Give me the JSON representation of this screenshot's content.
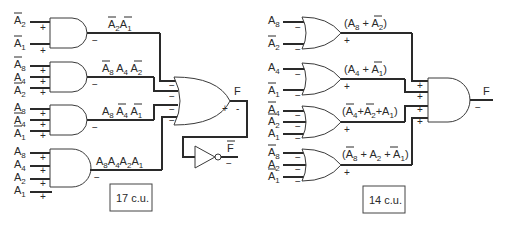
{
  "left_circuit": {
    "cost_label": "17 c.u.",
    "output_label": "F",
    "output_complement_label": "F",
    "and_gates": [
      {
        "inputs": [
          {
            "name": "A",
            "sub": "2",
            "bar": true
          },
          {
            "name": "A",
            "sub": "1",
            "bar": true
          }
        ],
        "input_polarity": "+",
        "output_polarity": "−",
        "term": "Ā2Ā1"
      },
      {
        "inputs": [
          {
            "name": "A",
            "sub": "8",
            "bar": true
          },
          {
            "name": "A",
            "sub": "4",
            "bar": false
          },
          {
            "name": "A",
            "sub": "2",
            "bar": true
          }
        ],
        "input_polarity": "+",
        "output_polarity": "−",
        "term": "Ā8A4Ā2"
      },
      {
        "inputs": [
          {
            "name": "A",
            "sub": "8",
            "bar": false
          },
          {
            "name": "A",
            "sub": "4",
            "bar": true
          },
          {
            "name": "A",
            "sub": "1",
            "bar": true
          }
        ],
        "input_polarity": "+",
        "output_polarity": "−",
        "term": "A8Ā4Ā1"
      },
      {
        "inputs": [
          {
            "name": "A",
            "sub": "8",
            "bar": false
          },
          {
            "name": "A",
            "sub": "4",
            "bar": false
          },
          {
            "name": "A",
            "sub": "2",
            "bar": false
          },
          {
            "name": "A",
            "sub": "1",
            "bar": false
          }
        ],
        "input_polarity": "+",
        "output_polarity": "−",
        "term": "A8A4A2A1"
      }
    ],
    "or_gate": {
      "input_polarity": "−",
      "output_polarity_plus": "+",
      "output_polarity_minus": "-"
    },
    "inverter": {
      "output_polarity": "−"
    }
  },
  "right_circuit": {
    "cost_label": "14 c.u.",
    "output_label": "F",
    "or_gates": [
      {
        "inputs": [
          {
            "name": "A",
            "sub": "8",
            "bar": false
          },
          {
            "name": "A",
            "sub": "2",
            "bar": true
          }
        ],
        "input_polarity": "−",
        "output_polarity": "+",
        "term": "(A8+Ā2)"
      },
      {
        "inputs": [
          {
            "name": "A",
            "sub": "4",
            "bar": false
          },
          {
            "name": "A",
            "sub": "1",
            "bar": true
          }
        ],
        "input_polarity": "−",
        "output_polarity": "+",
        "term": "(A4+Ā1)"
      },
      {
        "inputs": [
          {
            "name": "A",
            "sub": "4",
            "bar": true
          },
          {
            "name": "A",
            "sub": "2",
            "bar": true
          },
          {
            "name": "A",
            "sub": "1",
            "bar": false
          }
        ],
        "input_polarity": "−",
        "output_polarity": "+",
        "term": "(Ā4+Ā2+A1)"
      },
      {
        "inputs": [
          {
            "name": "A",
            "sub": "8",
            "bar": true
          },
          {
            "name": "A",
            "sub": "2",
            "bar": false
          },
          {
            "name": "A",
            "sub": "1",
            "bar": true
          }
        ],
        "input_polarity": "−",
        "output_polarity": "+",
        "term": "(Ā8+A2+Ā1)"
      }
    ],
    "and_gate": {
      "input_polarity": "+",
      "output_polarity": "−"
    }
  }
}
